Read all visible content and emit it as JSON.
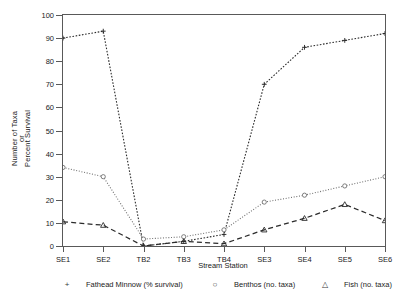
{
  "chart_data": {
    "type": "line",
    "title": "",
    "xlabel": "Stream Station",
    "ylabel": "Percent Survival or Number of Taxa",
    "ylabel_lines": [
      "Percent Survival",
      "or",
      "Number of Taxa"
    ],
    "categories": [
      "SE1",
      "SE2",
      "TB2",
      "TB3",
      "TB4",
      "SE3",
      "SE4",
      "SE5",
      "SE6"
    ],
    "ylim": [
      0,
      100
    ],
    "yticks": [
      0,
      10,
      20,
      30,
      40,
      50,
      60,
      70,
      80,
      90,
      100
    ],
    "grid": false,
    "legend_position": "below",
    "series": [
      {
        "name": "Fathead Minnow (% survival)",
        "marker": "plus",
        "marker_glyph": "+",
        "line_style": "dotted",
        "color": "#2b2b2b",
        "values": [
          90,
          93,
          0,
          2,
          5,
          70,
          86,
          89,
          92
        ]
      },
      {
        "name": "Benthos (no. taxa)",
        "marker": "circle",
        "marker_glyph": "○",
        "line_style": "fine-dotted",
        "color": "#707070",
        "values": [
          34,
          30,
          3,
          4,
          7,
          19,
          22,
          26,
          30
        ]
      },
      {
        "name": "Fish (no. taxa)",
        "marker": "triangle",
        "marker_glyph": "△",
        "line_style": "dashed",
        "color": "#2b2b2b",
        "values": [
          10.5,
          9,
          0,
          2,
          1,
          7,
          12,
          18,
          11
        ]
      }
    ]
  }
}
